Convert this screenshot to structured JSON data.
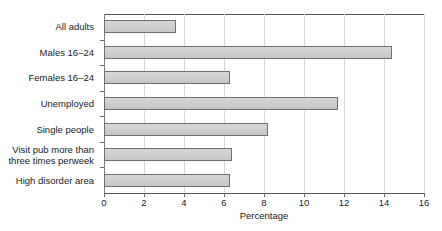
{
  "chart_data": {
    "type": "bar",
    "orientation": "horizontal",
    "title": "",
    "xlabel": "Percentage",
    "ylabel": "",
    "xlim": [
      0,
      16
    ],
    "xticks": [
      0,
      2,
      4,
      6,
      8,
      10,
      12,
      14,
      16
    ],
    "xtick_labels": [
      "0",
      "2",
      "4",
      "6",
      "8",
      "10",
      "12",
      "14",
      "16"
    ],
    "grid": "vertical",
    "legend": "none",
    "categories": [
      "All adults",
      "Males 16–24",
      "Females 16–24",
      "Unemployed",
      "Single people",
      "Visit pub more than three times perweek",
      "High disorder area"
    ],
    "category_lines": [
      [
        "All adults"
      ],
      [
        "Males 16–24"
      ],
      [
        "Females 16–24"
      ],
      [
        "Unemployed"
      ],
      [
        "Single people"
      ],
      [
        "Visit pub more than",
        "three times perweek"
      ],
      [
        "High disorder area"
      ]
    ],
    "values": [
      3.6,
      14.4,
      6.3,
      11.7,
      8.2,
      6.4,
      6.3
    ],
    "series": [
      {
        "name": "Percentage",
        "values": [
          3.6,
          14.4,
          6.3,
          11.7,
          8.2,
          6.4,
          6.3
        ]
      }
    ],
    "colors": {
      "bar_fill": "#d1d1d1",
      "bar_outline": "#6e6e6e",
      "gridline": "#d8d8d8",
      "axis": "#555555",
      "text": "#1a1a1a",
      "background": "#ffffff"
    }
  }
}
